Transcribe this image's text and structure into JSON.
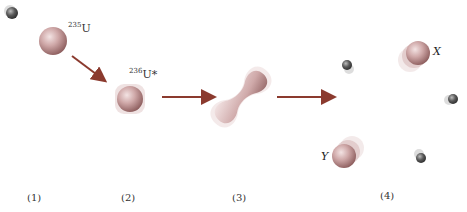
{
  "labels": {
    "u235": {
      "mass": "235",
      "symbol": "U"
    },
    "u236": {
      "mass": "236",
      "symbol": "U*"
    },
    "fragment_x": "X",
    "fragment_y": "Y"
  },
  "steps": [
    "(1)",
    "(2)",
    "(3)",
    "(4)"
  ],
  "colors": {
    "nucleus": "#c9a3a3",
    "nucleus_dark": "#8f5f5f",
    "neutron": "#4a4a4a",
    "arrow": "#8b3a2e"
  }
}
